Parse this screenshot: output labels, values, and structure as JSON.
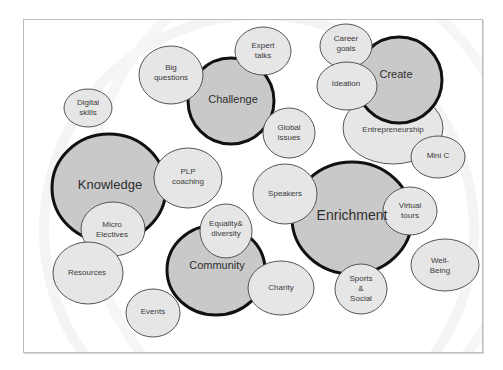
{
  "diagram": {
    "type": "bubble-cluster",
    "colors": {
      "main_fill": "#c9c9c9",
      "sub_fill": "#e6e6e6",
      "main_stroke": "#111111",
      "sub_stroke": "#555555",
      "frame_border": "#bdbdbd"
    },
    "main_nodes": [
      {
        "id": "knowledge",
        "label": "Knowledge"
      },
      {
        "id": "challenge",
        "label": "Challenge"
      },
      {
        "id": "create",
        "label": "Create"
      },
      {
        "id": "community",
        "label": "Community"
      },
      {
        "id": "enrichment",
        "label": "Enrichment"
      }
    ],
    "sub_nodes": [
      {
        "id": "big-questions",
        "label": "Big\nquestions",
        "group": "challenge"
      },
      {
        "id": "expert-talks",
        "label": "Expert\ntalks",
        "group": "challenge"
      },
      {
        "id": "global-issues",
        "label": "Global\nissues",
        "group": "challenge"
      },
      {
        "id": "career-goals",
        "label": "Career\ngoals",
        "group": "create"
      },
      {
        "id": "ideation",
        "label": "Ideation",
        "group": "create"
      },
      {
        "id": "entrepreneurship",
        "label": "Entrepreneurship",
        "group": "create"
      },
      {
        "id": "mini-c",
        "label": "Mini C",
        "group": "create"
      },
      {
        "id": "digital-skills",
        "label": "Digital\nskills",
        "group": "knowledge"
      },
      {
        "id": "plp-coaching",
        "label": "PLP\ncoaching",
        "group": "knowledge"
      },
      {
        "id": "micro-electives",
        "label": "Micro\nElectives",
        "group": "knowledge"
      },
      {
        "id": "resources",
        "label": "Resources",
        "group": "knowledge"
      },
      {
        "id": "events",
        "label": "Events",
        "group": "community"
      },
      {
        "id": "equality-diversity",
        "label": "Equality&\ndiversity",
        "group": "community"
      },
      {
        "id": "charity",
        "label": "Charity",
        "group": "community"
      },
      {
        "id": "speakers",
        "label": "Speakers",
        "group": "enrichment"
      },
      {
        "id": "virtual-tours",
        "label": "Virtual\ntours",
        "group": "enrichment"
      },
      {
        "id": "sports-social",
        "label": "Sports\n&\nSocial",
        "group": "enrichment"
      },
      {
        "id": "well-being",
        "label": "Well-\nBeing",
        "group": "enrichment"
      }
    ]
  }
}
